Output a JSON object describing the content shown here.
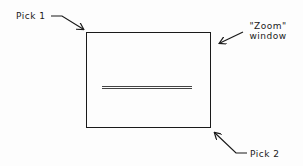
{
  "diagram": {
    "pick1_label": "Pick 1",
    "zoom_window_label_line1": "\"Zoom\"",
    "zoom_window_label_line2": "window",
    "pick2_label": "Pick 2"
  },
  "colors": {
    "ink": "#1a1a1a",
    "background": "#fdfdfd"
  }
}
